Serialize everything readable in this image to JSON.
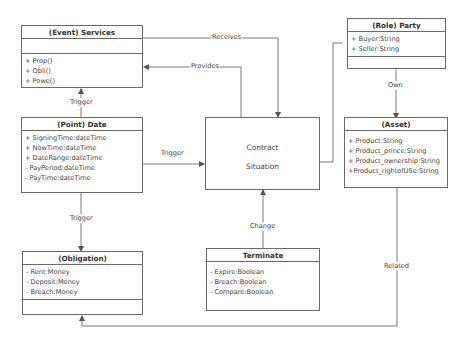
{
  "diagram": {
    "type": "uml-class-diagram",
    "classes": {
      "services": {
        "title": "(Event) Services",
        "attributes": [],
        "operations": [
          "+ Prop()",
          "+ Obli()",
          "+ Powe()"
        ]
      },
      "date": {
        "title": "(Point) Date",
        "attributes": [
          "+ SigningTime:dateTime",
          "+ NowTime:dateTime",
          "+ DateRange:dateTime",
          "-  PayPeriod:dateTime",
          "-  PayTime:dateTime"
        ]
      },
      "obligation": {
        "title": "(Obligation)",
        "attributes": [
          "- Rent:Money",
          "- Deposit:Money",
          "- Breach:Money"
        ],
        "operations": []
      },
      "contract": {
        "line1": "Contract",
        "line2": "Situation"
      },
      "terminate": {
        "title": "Terminate",
        "attributes": [
          "- Expire:Boolean",
          "- Breach:Boolean",
          "- Compare:Boolean"
        ]
      },
      "party": {
        "title": "(Role) Party",
        "attributes": [
          "+ Buyer:String",
          "+ Seller:String"
        ],
        "operations": []
      },
      "asset": {
        "title": "(Asset)",
        "attributes": [
          "+ Product:String",
          "+ Product_prince:String",
          "+ Product_ownership:String",
          "+Product_rightofUSe:String"
        ]
      }
    },
    "relations": {
      "receives": "Receives",
      "provides": "Provides",
      "trigger_date_services": "Trigger",
      "trigger_date_contract": "Trigger",
      "trigger_date_obligation": "Trigger",
      "change": "Change",
      "own": "Own",
      "related": "Related"
    },
    "colors": {
      "line": "#6b6b6b",
      "text": "#444444",
      "background": "#ffffff"
    }
  }
}
